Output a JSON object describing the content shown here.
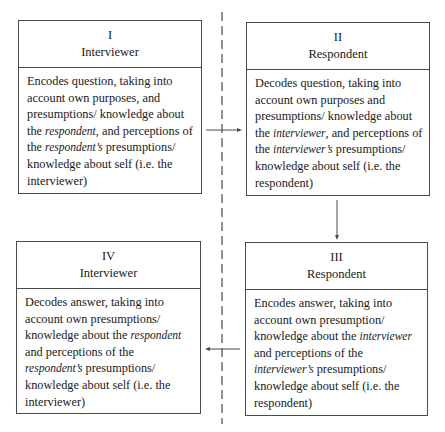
{
  "diagram": {
    "type": "communication-cycle",
    "divider": "dashed vertical line separating interviewer and respondent sides",
    "boxes": [
      {
        "id": "I",
        "numeral": "I",
        "role": "Interviewer",
        "text_parts": [
          "Encodes question, taking into account own purposes, and presumptions/ knowledge about the ",
          "respondent",
          ", and perceptions of the ",
          "respondent’s",
          " presumptions/ knowledge about self (i.e. the interviewer)"
        ]
      },
      {
        "id": "II",
        "numeral": "II",
        "role": "Respondent",
        "text_parts": [
          "Decodes question, taking into account own purposes and presumptions/ knowledge about the ",
          "interviewer",
          ", and perceptions of the ",
          "interviewer’s",
          " presumptions/ knowledge about self (i.e. the respondent)"
        ]
      },
      {
        "id": "III",
        "numeral": "III",
        "role": "Respondent",
        "text_parts": [
          "Encodes answer, taking into account own presumption/ knowledge about the ",
          "interviewer",
          " and perceptions of the ",
          "interviewer’s",
          " presumptions/ knowledge about self (i.e. the respondent)"
        ]
      },
      {
        "id": "IV",
        "numeral": "IV",
        "role": "Interviewer",
        "text_parts": [
          "Decodes answer, taking into account own presumptions/ knowledge about the ",
          "respondent",
          " and perceptions of the ",
          "respondent’s",
          " presumptions/ knowledge about self (i.e. the interviewer)"
        ]
      }
    ],
    "arrows": [
      {
        "from": "I",
        "to": "II",
        "direction": "right"
      },
      {
        "from": "II",
        "to": "III",
        "direction": "down"
      },
      {
        "from": "III",
        "to": "IV",
        "direction": "left"
      }
    ],
    "colors": {
      "line": "#4a4a4a",
      "text": "#1a1a1a",
      "background": "#ffffff"
    }
  }
}
